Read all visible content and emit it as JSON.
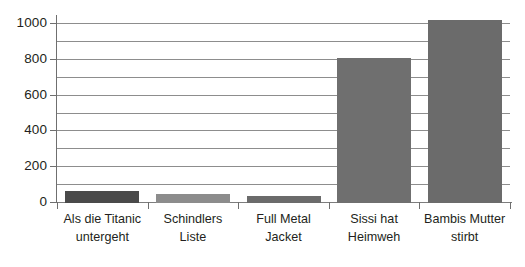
{
  "chart_data": {
    "type": "bar",
    "title": "",
    "subtitle": "",
    "xlabel": "",
    "ylabel": "",
    "categories": [
      "Als die Titanic untergeht",
      "Schindlers Liste",
      "Full Metal Jacket",
      "Sissi hat Heimweh",
      "Bambis Mutter stirbt"
    ],
    "category_lines": [
      [
        "Als die Titanic",
        "untergeht"
      ],
      [
        "Schindlers",
        "Liste"
      ],
      [
        "Full Metal",
        "Jacket"
      ],
      [
        "Sissi hat",
        "Heimweh"
      ],
      [
        "Bambis Mutter",
        "stirbt"
      ]
    ],
    "values": [
      65,
      48,
      40,
      810,
      1025
    ],
    "bar_colors": [
      "#4a4a4a",
      "#8c8c8c",
      "#6b6b6b",
      "#6f6f6f",
      "#6b6b6b"
    ],
    "ylim": [
      0,
      1045
    ],
    "ytick_values": [
      0,
      200,
      400,
      600,
      800,
      1000
    ],
    "ytick_labels": [
      "0",
      "200",
      "400",
      "600",
      "800",
      "1000"
    ],
    "minor_tick_step": 100,
    "grid": true,
    "grid_axis": "y",
    "legend": false,
    "legend_position": "none",
    "gridline_color": "#8d8d8d",
    "axis_color": "#6f6f6f",
    "text_color": "#231f20",
    "background_color": "#ffffff"
  }
}
